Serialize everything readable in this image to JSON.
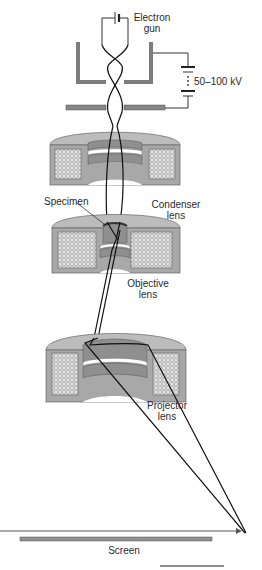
{
  "diagram": {
    "labels": {
      "electron_gun_line1": "Electron",
      "electron_gun_line2": "gun",
      "voltage": "50–100 kV",
      "condenser_line1": "Condenser",
      "condenser_line2": "lens",
      "specimen": "Specimen",
      "objective_line1": "Objective",
      "objective_line2": "lens",
      "projector_line1": "Projector",
      "projector_line2": "lens",
      "screen": "Screen"
    },
    "colors": {
      "lens_body": "#a9a9a9",
      "lens_top": "#bdbdbd",
      "lens_inner": "#8f8f8f",
      "coil_fill": "#e6e6e6",
      "plate": "#808080",
      "beam": "#111111",
      "label": "#2a2a2a"
    }
  }
}
